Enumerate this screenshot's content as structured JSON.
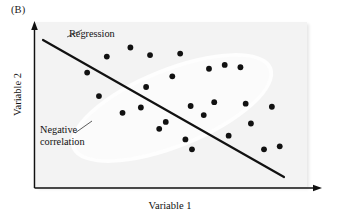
{
  "figure": {
    "panel_label": "(B)",
    "background_color": "#f3f3f3",
    "axis_color": "#111111",
    "point_color": "#111111",
    "regression_line_color": "#111111"
  },
  "axes": {
    "xlabel": "Variable 1",
    "ylabel": "Variable 2"
  },
  "annotations": {
    "regression": "Regression",
    "negative_correlation_line1": "Negative",
    "negative_correlation_line2": "correlation"
  },
  "chart_data": {
    "type": "scatter",
    "title": "(B)",
    "xlabel": "Variable 1",
    "ylabel": "Variable 2",
    "xlim": [
      0,
      100
    ],
    "ylim": [
      0,
      100
    ],
    "grid": false,
    "legend": null,
    "annotations": [
      {
        "text": "Regression",
        "target": "regression line"
      },
      {
        "text": "Negative correlation",
        "target": "point cloud"
      }
    ],
    "series": [
      {
        "name": "observations",
        "points": [
          {
            "x": 18.0,
            "y": 72.0
          },
          {
            "x": 22.5,
            "y": 56.5
          },
          {
            "x": 25.5,
            "y": 82.5
          },
          {
            "x": 31.5,
            "y": 45.5
          },
          {
            "x": 34.5,
            "y": 88.5
          },
          {
            "x": 38.5,
            "y": 49.0
          },
          {
            "x": 40.5,
            "y": 62.5
          },
          {
            "x": 42.0,
            "y": 83.5
          },
          {
            "x": 45.5,
            "y": 35.0
          },
          {
            "x": 48.0,
            "y": 39.5
          },
          {
            "x": 50.5,
            "y": 69.5
          },
          {
            "x": 53.5,
            "y": 84.5
          },
          {
            "x": 55.5,
            "y": 28.0
          },
          {
            "x": 57.5,
            "y": 50.0
          },
          {
            "x": 58.0,
            "y": 21.5
          },
          {
            "x": 62.5,
            "y": 44.0
          },
          {
            "x": 64.5,
            "y": 74.5
          },
          {
            "x": 66.5,
            "y": 52.5
          },
          {
            "x": 70.5,
            "y": 77.0
          },
          {
            "x": 72.0,
            "y": 30.5
          },
          {
            "x": 76.5,
            "y": 75.5
          },
          {
            "x": 78.5,
            "y": 51.5
          },
          {
            "x": 80.5,
            "y": 38.5
          },
          {
            "x": 85.5,
            "y": 21.5
          },
          {
            "x": 88.5,
            "y": 49.5
          },
          {
            "x": 91.5,
            "y": 23.5
          }
        ]
      }
    ],
    "regression_line": {
      "x_start": 3.0,
      "y_start": 89.5,
      "x_end": 91.5,
      "y_end": 6.5,
      "slope": "negative"
    },
    "correlation": "negative"
  }
}
